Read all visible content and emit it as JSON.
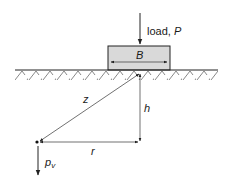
{
  "figure": {
    "type": "point load beneath footing geometry",
    "colors": {
      "line": "#222222",
      "footing_fill": "#d9d9d9",
      "background": "#ffffff"
    }
  },
  "labels": {
    "load_text": "load, ",
    "load_symbol": "P",
    "footing_width": "B",
    "slant_distance": "z",
    "depth": "h",
    "radial_distance": "r",
    "stress_base": "p",
    "stress_sub": "v"
  }
}
